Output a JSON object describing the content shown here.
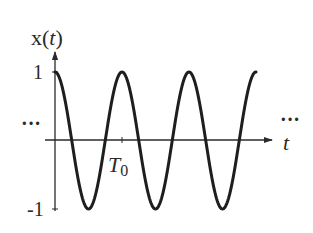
{
  "figure": {
    "y_axis_label_prefix": "x(",
    "y_axis_label_var": "t",
    "y_axis_label_suffix": ")",
    "x_axis_label": "t",
    "tick_labels": {
      "y_max": "1",
      "y_min": "-1",
      "period_main": "T",
      "period_sub": "0"
    },
    "ellipsis_left": "···",
    "ellipsis_right": "···",
    "colors": {
      "curve": "#1e1e1e",
      "axes": "#2a2a2a",
      "background": "#ffffff"
    }
  },
  "chart_data": {
    "type": "line",
    "title": "",
    "xlabel": "t",
    "ylabel": "x(t)",
    "function": "cos(2*pi*t/T0)",
    "period_label": "T0",
    "ylim": [
      -1,
      1
    ],
    "yticks": [
      -1,
      1
    ],
    "xticks": [
      "T0"
    ],
    "x_range_periods": [
      0,
      3
    ],
    "note": "periodic continuation indicated by ellipses on both sides",
    "grid": false
  }
}
